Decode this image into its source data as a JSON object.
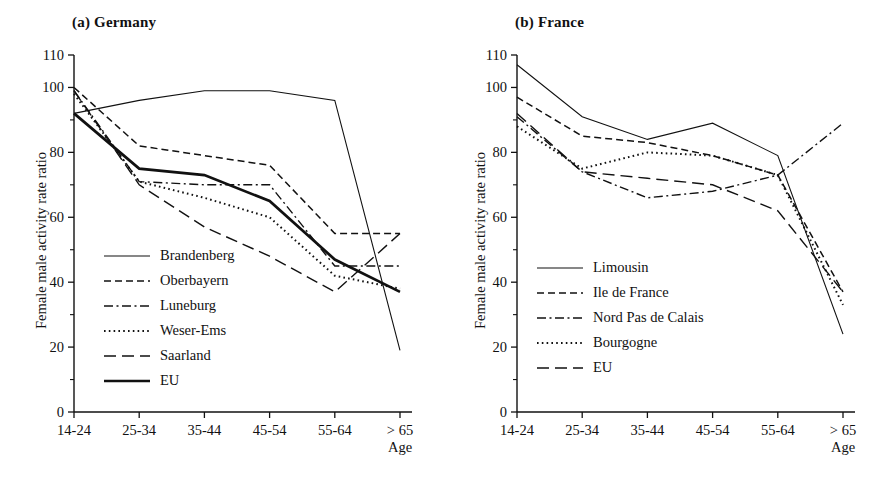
{
  "figure": {
    "ylabel": "Female male activity rate ratio",
    "xlabel": "Age",
    "categories": [
      "14-24",
      "25-34",
      "35-44",
      "45-54",
      "55-64",
      "> 65"
    ],
    "ytick_labels": [
      "0",
      "20",
      "40",
      "60",
      "80",
      "100",
      "110"
    ],
    "ylim": [
      0,
      110
    ]
  },
  "chart_data": [
    {
      "type": "line",
      "title": "(a) Germany",
      "xlabel": "Age",
      "ylabel": "Female male activity rate ratio",
      "categories": [
        "14-24",
        "25-34",
        "35-44",
        "45-54",
        "55-64",
        "> 65"
      ],
      "ylim": [
        0,
        110
      ],
      "yticks": [
        0,
        20,
        40,
        60,
        80,
        100,
        110
      ],
      "yticks_minor": [
        10,
        30,
        50,
        70,
        90
      ],
      "grid": false,
      "legend_position": "lower-left inside axes",
      "series": [
        {
          "name": "Brandenberg",
          "style": "solid",
          "values": [
            92,
            96,
            99,
            99,
            96,
            19
          ]
        },
        {
          "name": "Oberbayern",
          "style": "dashed",
          "values": [
            100,
            82,
            79,
            76,
            55,
            55
          ]
        },
        {
          "name": "Luneburg",
          "style": "dash-dot",
          "values": [
            99,
            71,
            70,
            70,
            45,
            45
          ]
        },
        {
          "name": "Weser-Ems",
          "style": "dotted",
          "values": [
            98,
            71,
            66,
            60,
            42,
            38
          ]
        },
        {
          "name": "Saarland",
          "style": "long-dash",
          "values": [
            99,
            70,
            57,
            48,
            37,
            55
          ]
        },
        {
          "name": "EU",
          "style": "solid-bold",
          "values": [
            92,
            75,
            73,
            65,
            47,
            37
          ]
        }
      ]
    },
    {
      "type": "line",
      "title": "(b) France",
      "xlabel": "Age",
      "ylabel": "Female male activity rate ratio",
      "categories": [
        "14-24",
        "25-34",
        "35-44",
        "45-54",
        "55-64",
        "> 65"
      ],
      "ylim": [
        0,
        110
      ],
      "yticks": [
        0,
        20,
        40,
        60,
        80,
        100,
        110
      ],
      "yticks_minor": [
        10,
        30,
        50,
        70,
        90
      ],
      "grid": false,
      "legend_position": "lower-left inside axes",
      "series": [
        {
          "name": "Limousin",
          "style": "solid",
          "values": [
            107,
            91,
            84,
            89,
            79,
            24
          ]
        },
        {
          "name": "Ile de France",
          "style": "dashed",
          "values": [
            97,
            85,
            83,
            79,
            73,
            37
          ]
        },
        {
          "name": "Nord Pas de Calais",
          "style": "dash-dot",
          "values": [
            91,
            74,
            66,
            68,
            73,
            89
          ]
        },
        {
          "name": "Bourgogne",
          "style": "dotted",
          "values": [
            88,
            75,
            80,
            79,
            73,
            33
          ]
        },
        {
          "name": "EU",
          "style": "long-dash",
          "values": [
            92,
            74,
            72,
            70,
            62,
            37
          ]
        }
      ]
    }
  ],
  "panel_a": {
    "title": "(a) Germany",
    "legend": [
      {
        "label": "Brandenberg"
      },
      {
        "label": "Oberbayern"
      },
      {
        "label": "Luneburg"
      },
      {
        "label": "Weser-Ems"
      },
      {
        "label": "Saarland"
      },
      {
        "label": "EU"
      }
    ]
  },
  "panel_b": {
    "title": "(b) France",
    "legend": [
      {
        "label": "Limousin"
      },
      {
        "label": "Ile de France"
      },
      {
        "label": "Nord Pas de Calais"
      },
      {
        "label": "Bourgogne"
      },
      {
        "label": "EU"
      }
    ]
  }
}
